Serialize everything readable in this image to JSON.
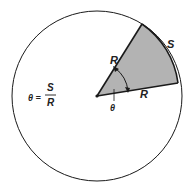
{
  "diagram": {
    "type": "radian-definition",
    "labels": {
      "radius_top": "R",
      "radius_bottom": "R",
      "arc": "S",
      "angle": "θ",
      "formula_lhs": "θ =",
      "formula_num": "S",
      "formula_den": "R"
    },
    "colors": {
      "sector_fill": "#b3b3b3",
      "stroke": "#1a1a1a",
      "background": "#ffffff"
    }
  }
}
